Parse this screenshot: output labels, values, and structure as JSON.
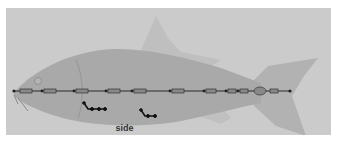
{
  "viewport": {
    "camera_label": "side",
    "background_color": "#cbcbcb",
    "model": {
      "name": "fish",
      "body_color": "#a9a9a9",
      "fin_color": "#b9b9b9"
    },
    "skeleton": {
      "spine_joint_count": 12,
      "fin_joint_chains": 2
    }
  }
}
